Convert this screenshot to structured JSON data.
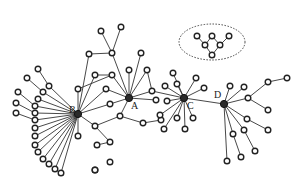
{
  "diagram": {
    "type": "network-graph",
    "hubs": [
      {
        "id": "A",
        "label": "A",
        "x": 129,
        "y": 98
      },
      {
        "id": "B",
        "label": "B",
        "x": 78,
        "y": 114
      },
      {
        "id": "C",
        "label": "C",
        "x": 184,
        "y": 98
      },
      {
        "id": "D",
        "label": "D",
        "x": 224,
        "y": 104
      }
    ],
    "nodes": [
      {
        "id": "a1",
        "x": 101,
        "y": 31
      },
      {
        "id": "a2",
        "x": 121,
        "y": 27
      },
      {
        "id": "a3",
        "x": 89,
        "y": 54
      },
      {
        "id": "a4",
        "x": 112,
        "y": 53
      },
      {
        "id": "a5",
        "x": 141,
        "y": 53
      },
      {
        "id": "a6",
        "x": 95,
        "y": 75
      },
      {
        "id": "a7",
        "x": 112,
        "y": 75
      },
      {
        "id": "a8",
        "x": 129,
        "y": 70
      },
      {
        "id": "a9",
        "x": 147,
        "y": 70
      },
      {
        "id": "a10",
        "x": 152,
        "y": 91
      },
      {
        "id": "a11",
        "x": 156,
        "y": 100
      },
      {
        "id": "a12",
        "x": 106,
        "y": 89
      },
      {
        "id": "a13",
        "x": 110,
        "y": 104
      },
      {
        "id": "a14",
        "x": 120,
        "y": 116
      },
      {
        "id": "a15",
        "x": 143,
        "y": 123
      },
      {
        "id": "a16",
        "x": 161,
        "y": 120
      },
      {
        "id": "b1",
        "x": 78,
        "y": 89
      },
      {
        "id": "b2",
        "x": 95,
        "y": 126
      },
      {
        "id": "b3",
        "x": 78,
        "y": 136
      },
      {
        "id": "b4",
        "x": 97,
        "y": 145
      },
      {
        "id": "b5",
        "x": 110,
        "y": 142
      },
      {
        "id": "b6",
        "x": 95,
        "y": 170
      },
      {
        "id": "lx1",
        "x": 38,
        "y": 69
      },
      {
        "id": "lx2",
        "x": 27,
        "y": 78
      },
      {
        "id": "lx3",
        "x": 49,
        "y": 86
      },
      {
        "id": "lx4",
        "x": 43,
        "y": 92
      },
      {
        "id": "lx5",
        "x": 18,
        "y": 92
      },
      {
        "id": "lx6",
        "x": 38,
        "y": 99
      },
      {
        "id": "lx7",
        "x": 16,
        "y": 103
      },
      {
        "id": "lx8",
        "x": 35,
        "y": 106
      },
      {
        "id": "lx9",
        "x": 16,
        "y": 113
      },
      {
        "id": "lx10",
        "x": 35,
        "y": 113
      },
      {
        "id": "lx11",
        "x": 35,
        "y": 120
      },
      {
        "id": "lx12",
        "x": 35,
        "y": 128
      },
      {
        "id": "lx13",
        "x": 35,
        "y": 136
      },
      {
        "id": "lx14",
        "x": 35,
        "y": 145
      },
      {
        "id": "lx15",
        "x": 38,
        "y": 152
      },
      {
        "id": "lx16",
        "x": 43,
        "y": 159
      },
      {
        "id": "lx17",
        "x": 49,
        "y": 164
      },
      {
        "id": "lx18",
        "x": 55,
        "y": 169
      },
      {
        "id": "lx19",
        "x": 61,
        "y": 173
      },
      {
        "id": "c1",
        "x": 173,
        "y": 73
      },
      {
        "id": "c2",
        "x": 196,
        "y": 78
      },
      {
        "id": "c3",
        "x": 165,
        "y": 86
      },
      {
        "id": "c4",
        "x": 204,
        "y": 88
      },
      {
        "id": "c5",
        "x": 167,
        "y": 101
      },
      {
        "id": "c6",
        "x": 160,
        "y": 115
      },
      {
        "id": "c7",
        "x": 177,
        "y": 118
      },
      {
        "id": "c8",
        "x": 193,
        "y": 118
      },
      {
        "id": "c9",
        "x": 164,
        "y": 129
      },
      {
        "id": "c10",
        "x": 185,
        "y": 129
      },
      {
        "id": "c11",
        "x": 177,
        "y": 84
      },
      {
        "id": "d1",
        "x": 230,
        "y": 86
      },
      {
        "id": "d2",
        "x": 244,
        "y": 87
      },
      {
        "id": "d3",
        "x": 248,
        "y": 98
      },
      {
        "id": "d4",
        "x": 268,
        "y": 82
      },
      {
        "id": "d5",
        "x": 287,
        "y": 78
      },
      {
        "id": "d6",
        "x": 268,
        "y": 110
      },
      {
        "id": "d7",
        "x": 247,
        "y": 119
      },
      {
        "id": "d8",
        "x": 244,
        "y": 130
      },
      {
        "id": "d9",
        "x": 268,
        "y": 130
      },
      {
        "id": "d10",
        "x": 233,
        "y": 134
      },
      {
        "id": "d11",
        "x": 255,
        "y": 151
      },
      {
        "id": "d12",
        "x": 241,
        "y": 157
      },
      {
        "id": "d13",
        "x": 227,
        "y": 161
      },
      {
        "id": "i1",
        "x": 110,
        "y": 162
      },
      {
        "id": "i2",
        "x": 95,
        "y": 170
      },
      {
        "id": "e1",
        "x": 197,
        "y": 36
      },
      {
        "id": "e2",
        "x": 212,
        "y": 36
      },
      {
        "id": "e3",
        "x": 229,
        "y": 36
      },
      {
        "id": "e4",
        "x": 205,
        "y": 45
      },
      {
        "id": "e5",
        "x": 220,
        "y": 45
      },
      {
        "id": "e6",
        "x": 212,
        "y": 55
      }
    ],
    "edges": [
      [
        "a2",
        "a4"
      ],
      [
        "a1",
        "a4"
      ],
      [
        "a3",
        "a4"
      ],
      [
        "a4",
        "A"
      ],
      [
        "a5",
        "A"
      ],
      [
        "a8",
        "A"
      ],
      [
        "a9",
        "A"
      ],
      [
        "a6",
        "a7"
      ],
      [
        "a7",
        "A"
      ],
      [
        "a9",
        "a10"
      ],
      [
        "a10",
        "A"
      ],
      [
        "a10",
        "C"
      ],
      [
        "a11",
        "A"
      ],
      [
        "a12",
        "A"
      ],
      [
        "a12",
        "B"
      ],
      [
        "a13",
        "A"
      ],
      [
        "a13",
        "B"
      ],
      [
        "a14",
        "A"
      ],
      [
        "a14",
        "a15"
      ],
      [
        "a15",
        "a16"
      ],
      [
        "a16",
        "c6"
      ],
      [
        "b1",
        "B"
      ],
      [
        "b1",
        "a7"
      ],
      [
        "b2",
        "B"
      ],
      [
        "b2",
        "a14"
      ],
      [
        "b3",
        "B"
      ],
      [
        "b2",
        "b5"
      ],
      [
        "b5",
        "b4"
      ],
      [
        "a3",
        "B"
      ],
      [
        "a6",
        "B"
      ],
      [
        "lx1",
        "lx3"
      ],
      [
        "lx3",
        "B"
      ],
      [
        "lx2",
        "lx4"
      ],
      [
        "lx4",
        "B"
      ],
      [
        "lx5",
        "lx8"
      ],
      [
        "lx6",
        "B"
      ],
      [
        "lx7",
        "lx10"
      ],
      [
        "lx8",
        "B"
      ],
      [
        "lx9",
        "lx11"
      ],
      [
        "lx10",
        "B"
      ],
      [
        "lx11",
        "B"
      ],
      [
        "lx12",
        "B"
      ],
      [
        "lx13",
        "B"
      ],
      [
        "lx14",
        "B"
      ],
      [
        "lx15",
        "B"
      ],
      [
        "lx16",
        "B"
      ],
      [
        "lx17",
        "B"
      ],
      [
        "lx18",
        "B"
      ],
      [
        "lx19",
        "B"
      ],
      [
        "c1",
        "C"
      ],
      [
        "c2",
        "C"
      ],
      [
        "c3",
        "C"
      ],
      [
        "c4",
        "C"
      ],
      [
        "c5",
        "C"
      ],
      [
        "c6",
        "C"
      ],
      [
        "c7",
        "C"
      ],
      [
        "c8",
        "C"
      ],
      [
        "c9",
        "C"
      ],
      [
        "c10",
        "C"
      ],
      [
        "c11",
        "C"
      ],
      [
        "C",
        "D"
      ],
      [
        "d1",
        "D"
      ],
      [
        "d2",
        "D"
      ],
      [
        "d3",
        "D"
      ],
      [
        "d3",
        "d4"
      ],
      [
        "d4",
        "d5"
      ],
      [
        "d3",
        "d6"
      ],
      [
        "d7",
        "D"
      ],
      [
        "d7",
        "d9"
      ],
      [
        "d8",
        "D"
      ],
      [
        "d10",
        "D"
      ],
      [
        "d8",
        "d11"
      ],
      [
        "d10",
        "d12"
      ],
      [
        "d13",
        "D"
      ],
      [
        "e1",
        "e4"
      ],
      [
        "e2",
        "e4"
      ],
      [
        "e2",
        "e5"
      ],
      [
        "e3",
        "e5"
      ],
      [
        "e4",
        "e6"
      ],
      [
        "e5",
        "e6"
      ]
    ],
    "inset": {
      "cx": 212,
      "cy": 42,
      "rx": 33,
      "ry": 18
    }
  }
}
